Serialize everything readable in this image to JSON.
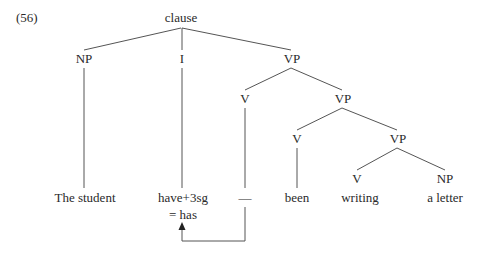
{
  "example_number": "(56)",
  "tree": {
    "root": "clause",
    "nodes": {
      "np_subject": "NP",
      "infl": "I",
      "vp1": "VP",
      "v1": "V",
      "vp2": "VP",
      "v2": "V",
      "vp3": "VP",
      "v3": "V",
      "np_object": "NP"
    },
    "leaves": {
      "subject": "The student",
      "infl_word": "have+3sg",
      "infl_result": "= has",
      "trace": "—",
      "been": "been",
      "writing": "writing",
      "object": "a letter"
    }
  },
  "colors": {
    "line": "#555555",
    "text": "#2a2a2a",
    "background": "#ffffff"
  }
}
